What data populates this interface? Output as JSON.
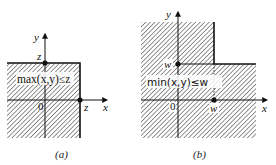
{
  "figure": {
    "panels": [
      {
        "id": "a",
        "caption": "(a)",
        "region_label": "max(x,y)≤z",
        "axis_x_label": "x",
        "axis_y_label": "y",
        "origin_label": "0",
        "point_y_label": "z",
        "point_x_label": "z",
        "description": "Shaded region where both x ≤ z and y ≤ z (lower-left quadrant anchored at (z,z))"
      },
      {
        "id": "b",
        "caption": "(b)",
        "region_label": "min(x,y)≤w",
        "axis_x_label": "x",
        "axis_y_label": "y",
        "origin_label": "0",
        "point_y_label": "w",
        "point_x_label": "w",
        "description": "Shaded region where x ≤ w or y ≤ w (everything except upper-right quadrant anchored at (w,w))"
      }
    ],
    "colors": {
      "hatch": "#555555",
      "line": "#111111",
      "background": "#ffffff"
    }
  }
}
